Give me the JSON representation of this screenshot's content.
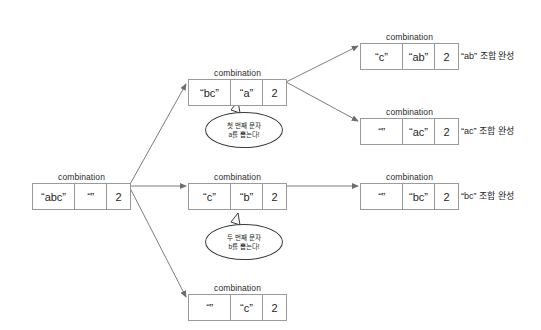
{
  "diagram": {
    "caption_label": "combination",
    "nodes": [
      {
        "id": "root",
        "caption": "combination",
        "cells": [
          "“abc”",
          "“”",
          "2"
        ],
        "x": 32,
        "y": 172
      },
      {
        "id": "branch-a",
        "caption": "combination",
        "cells": [
          "“bc”",
          "“a”",
          "2"
        ],
        "x": 188,
        "y": 68
      },
      {
        "id": "branch-b",
        "caption": "combination",
        "cells": [
          "“c”",
          "“b”",
          "2"
        ],
        "x": 188,
        "y": 172
      },
      {
        "id": "branch-c",
        "caption": "combination",
        "cells": [
          "“”",
          "“c”",
          "2"
        ],
        "x": 188,
        "y": 283
      },
      {
        "id": "leaf-ab",
        "caption": "combination",
        "cells": [
          "“c”",
          "“ab”",
          "2"
        ],
        "x": 360,
        "y": 32
      },
      {
        "id": "leaf-ac",
        "caption": "combination",
        "cells": [
          "“”",
          "“ac”",
          "2"
        ],
        "x": 360,
        "y": 107
      },
      {
        "id": "leaf-bc",
        "caption": "combination",
        "cells": [
          "“”",
          "“bc”",
          "2"
        ],
        "x": 360,
        "y": 172
      }
    ],
    "result_labels": [
      {
        "id": "result-ab",
        "text": "“ab” 조합 완성",
        "x": 461,
        "y": 32
      },
      {
        "id": "result-ac",
        "text": "“ac” 조합 완성",
        "x": 461,
        "y": 107
      },
      {
        "id": "result-bc",
        "text": "“bc” 조합 완성",
        "x": 461,
        "y": 172
      }
    ],
    "bubbles": [
      {
        "id": "bubble-first",
        "line1": "첫 번째 문자",
        "line2": "a를 뽑는다!",
        "x": 205,
        "y": 112
      },
      {
        "id": "bubble-second",
        "line1": "두 번째 문자",
        "line2": "b를 뽑는다!",
        "x": 205,
        "y": 224
      }
    ],
    "colors": {
      "box_border": "#9a9a9a",
      "edge": "#6e6e6e",
      "text": "#1f1f1f",
      "background": "#ffffff"
    }
  }
}
